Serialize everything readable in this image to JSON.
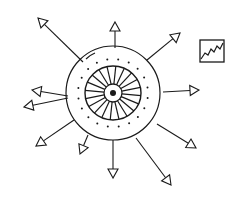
{
  "diagram": {
    "type": "radial-arrow-diagram",
    "stroke_color": "#1a1a1a",
    "background": "#ffffff",
    "center": {
      "x": 113,
      "y": 93
    },
    "outer_circle_radius": 47,
    "inner_wheel": {
      "rx": 28,
      "ry": 27,
      "spokes": 20,
      "hub_radius": 9,
      "center_dot_radius": 3
    },
    "dot_ring": {
      "radius": 35,
      "count": 20
    },
    "arrows": [
      {
        "name": "arrow-top-left",
        "x1": 83,
        "y1": 62,
        "x2": 38,
        "y2": 18
      },
      {
        "name": "arrow-top",
        "x1": 115,
        "y1": 48,
        "x2": 115,
        "y2": 22
      },
      {
        "name": "arrow-top-right",
        "x1": 147,
        "y1": 60,
        "x2": 180,
        "y2": 33
      },
      {
        "name": "arrow-right",
        "x1": 163,
        "y1": 92,
        "x2": 199,
        "y2": 90
      },
      {
        "name": "arrow-lower-right",
        "x1": 157,
        "y1": 124,
        "x2": 196,
        "y2": 148
      },
      {
        "name": "arrow-bottom-right",
        "x1": 136,
        "y1": 138,
        "x2": 171,
        "y2": 185
      },
      {
        "name": "arrow-bottom",
        "x1": 113,
        "y1": 140,
        "x2": 113,
        "y2": 178
      },
      {
        "name": "arrow-bottom-left-short",
        "x1": 88,
        "y1": 135,
        "x2": 80,
        "y2": 154
      },
      {
        "name": "arrow-left-lower",
        "x1": 74,
        "y1": 120,
        "x2": 36,
        "y2": 146
      },
      {
        "name": "arrow-left-upper",
        "x1": 68,
        "y1": 96,
        "x2": 32,
        "y2": 90
      },
      {
        "name": "arrow-left-middle",
        "x1": 68,
        "y1": 98,
        "x2": 24,
        "y2": 107
      }
    ],
    "chart_icon": {
      "x": 200,
      "y": 40,
      "width": 24,
      "height": 22,
      "label": "line-chart-icon"
    }
  }
}
